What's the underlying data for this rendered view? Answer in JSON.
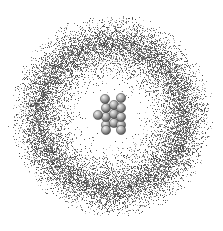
{
  "diagram": {
    "title": "Atom model: nucleus with electron cloud",
    "background": "#ffffff",
    "cloud": {
      "center": [
        111,
        116
      ],
      "inner_clear_radius": 42,
      "peak_radius": 72,
      "outer_radius": 104,
      "color": "#5a5a5a"
    },
    "nucleus": {
      "sphere_radius": 4.6,
      "color_light": "#f2f2f2",
      "color_mid": "#9a9a9a",
      "color_dark": "#4a4a4a",
      "spheres": [
        [
          106,
          125
        ],
        [
          114,
          123
        ],
        [
          121,
          125
        ],
        [
          106,
          117
        ],
        [
          114,
          114
        ],
        [
          121,
          117
        ],
        [
          98,
          115
        ],
        [
          106,
          108
        ],
        [
          114,
          105
        ],
        [
          121,
          108
        ],
        [
          106,
          130
        ],
        [
          121,
          130
        ],
        [
          105,
          99
        ],
        [
          121,
          98
        ]
      ]
    }
  }
}
